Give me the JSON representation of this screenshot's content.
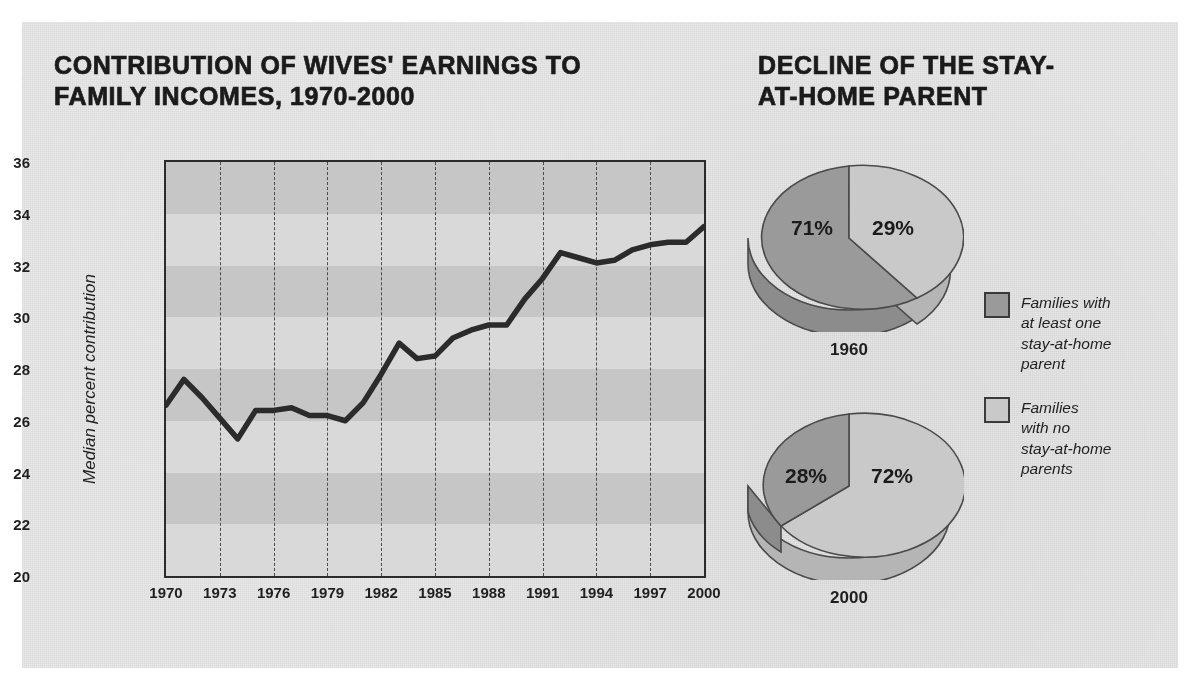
{
  "figure": {
    "left_title": "CONTRIBUTION OF WIVES' EARNINGS TO FAMILY INCOMES, 1970-2000",
    "right_title": "DECLINE OF THE STAY-AT-HOME PARENT"
  },
  "colors": {
    "panel_background": "#e9e9e9",
    "plot_background": "#d9d9d9",
    "band": "#c6c6c6",
    "line": "#2b2b2b",
    "pie_dark": "#9a9a9a",
    "pie_light": "#c9c9c9",
    "text": "#1f1f1f"
  },
  "chart_data": [
    {
      "type": "line",
      "title": "CONTRIBUTION OF WIVES' EARNINGS TO FAMILY INCOMES, 1970-2000",
      "xlabel": "",
      "ylabel": "Median percent contribution",
      "xlim": [
        1970,
        2000
      ],
      "ylim": [
        20,
        36
      ],
      "yticks": [
        20,
        22,
        24,
        26,
        28,
        30,
        32,
        34,
        36
      ],
      "xticks": [
        1970,
        1973,
        1976,
        1979,
        1982,
        1985,
        1988,
        1991,
        1994,
        1997,
        2000
      ],
      "grid": "vertical-dashed-at-xticks; horizontal-alternating-bands-every-2-units",
      "legend": "none",
      "x": [
        1970,
        1971,
        1972,
        1973,
        1974,
        1975,
        1976,
        1977,
        1978,
        1979,
        1980,
        1981,
        1982,
        1983,
        1984,
        1985,
        1986,
        1987,
        1988,
        1989,
        1990,
        1991,
        1992,
        1993,
        1994,
        1995,
        1996,
        1997,
        1998,
        1999,
        2000
      ],
      "values": [
        26.6,
        27.6,
        26.9,
        26.1,
        25.3,
        26.4,
        26.4,
        26.5,
        26.2,
        26.2,
        26.0,
        26.7,
        27.8,
        29.0,
        28.4,
        28.5,
        29.2,
        29.5,
        29.7,
        29.7,
        30.7,
        31.5,
        32.5,
        32.3,
        32.1,
        32.2,
        32.6,
        32.8,
        32.9,
        32.9,
        33.5
      ]
    },
    {
      "type": "pie",
      "title": "DECLINE OF THE STAY-AT-HOME PARENT",
      "subtitle": "1960",
      "labels": [
        "Families with at least one stay-at-home parent",
        "Families with no stay-at-home parents"
      ],
      "values": [
        71,
        29
      ],
      "value_labels": [
        "71%",
        "29%"
      ]
    },
    {
      "type": "pie",
      "title": "DECLINE OF THE STAY-AT-HOME PARENT",
      "subtitle": "2000",
      "labels": [
        "Families with at least one stay-at-home parent",
        "Families with no stay-at-home parents"
      ],
      "values": [
        28,
        72
      ],
      "value_labels": [
        "28%",
        "72%"
      ]
    }
  ],
  "line_chart": {
    "ylabel": "Median percent contribution",
    "yticks": [
      "36",
      "34",
      "32",
      "30",
      "28",
      "26",
      "24",
      "22",
      "20"
    ],
    "xticks": [
      "1970",
      "1973",
      "1976",
      "1979",
      "1982",
      "1985",
      "1988",
      "1991",
      "1994",
      "1997",
      "2000"
    ]
  },
  "pies": [
    {
      "caption": "1960",
      "dark_label": "71%",
      "light_label": "29%"
    },
    {
      "caption": "2000",
      "dark_label": "28%",
      "light_label": "72%"
    }
  ],
  "legend": {
    "items": [
      {
        "swatch": "dark",
        "text": "Families with\nat least one\nstay-at-home\nparent"
      },
      {
        "swatch": "light",
        "text": "Families\nwith no\nstay-at-home\nparents"
      }
    ]
  }
}
